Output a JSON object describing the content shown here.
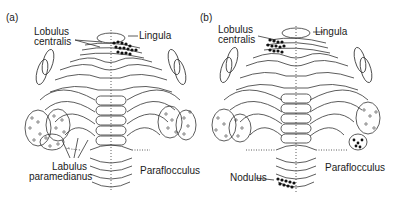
{
  "figure": {
    "panels": [
      {
        "id": "a",
        "label": "(a)",
        "labels": {
          "lobulus_centralis_1": "Lobulus",
          "lobulus_centralis_2": "centralis",
          "lingula": "Lingula",
          "lobulus_paramedianus_1": "Labulus",
          "lobulus_paramedianus_2": "paramedianus",
          "paraflocculus": "Paraflocculus"
        },
        "highlighted": [
          "Lingula",
          "Lobulus paramedianus",
          "Paraflocculus"
        ]
      },
      {
        "id": "b",
        "label": "(b)",
        "labels": {
          "lobulus_centralis_1": "Lobulus",
          "lobulus_centralis_2": "centralis",
          "lingula": "Lingula",
          "paraflocculus": "Paraflocculus",
          "nodulus": "Nodulus"
        },
        "highlighted": [
          "Lobulus centralis",
          "Paraflocculus",
          "Nodulus"
        ]
      }
    ],
    "colors": {
      "line": "#333333",
      "fill_dark": "#111111",
      "background": "#ffffff"
    }
  }
}
